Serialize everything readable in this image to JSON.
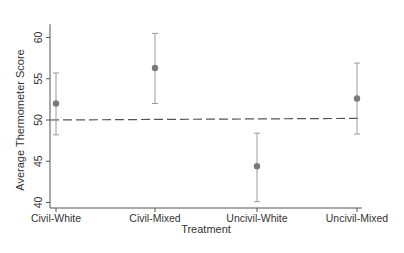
{
  "chart_data": {
    "type": "scatter",
    "subtype": "point-with-error-bars",
    "title": "",
    "xlabel": "Treatment",
    "ylabel": "Average Thermometer Score",
    "categories": [
      "Civil-White",
      "Civil-Mixed",
      "Uncivil-White",
      "Uncivil-Mixed"
    ],
    "series": [
      {
        "name": "Average Thermometer Score",
        "values": [
          52.0,
          56.3,
          44.4,
          52.6
        ],
        "ci_lower": [
          48.2,
          52.0,
          40.1,
          48.3
        ],
        "ci_upper": [
          55.7,
          60.5,
          48.4,
          56.9
        ]
      }
    ],
    "reference_line": {
      "style": "dashed",
      "y_start": 50.0,
      "y_end": 50.2
    },
    "ylim": [
      40,
      61
    ],
    "yticks": [
      40,
      45,
      50,
      55,
      60
    ],
    "grid": false,
    "legend": "none"
  },
  "colors": {
    "marker": "#7a7a7a",
    "errorbar": "#9a9a9a",
    "axis": "#555555",
    "reference_line": "#555555"
  }
}
